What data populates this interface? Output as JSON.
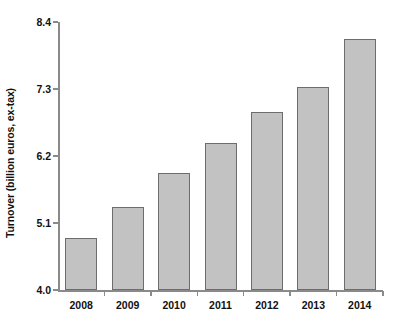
{
  "chart_data": {
    "type": "bar",
    "title": "",
    "xlabel": "",
    "ylabel": "Turnover (billion euros, ex-tax)",
    "categories": [
      "2008",
      "2009",
      "2010",
      "2011",
      "2012",
      "2013",
      "2014"
    ],
    "values": [
      4.85,
      5.36,
      5.92,
      6.41,
      6.92,
      7.33,
      8.12
    ],
    "ylim": [
      4.0,
      8.4
    ],
    "yticks": [
      4.0,
      5.1,
      6.2,
      7.3,
      8.4
    ],
    "ytick_labels": [
      "4.0",
      "5.1",
      "6.2",
      "7.3",
      "8.4"
    ],
    "grid": false,
    "legend": null,
    "bar_color": "#c2c2c2",
    "bar_edge_color": "#6d6d6d",
    "background_color": "#ffffff",
    "axis_color": "#8a8a8a",
    "text_color": "#111111"
  }
}
